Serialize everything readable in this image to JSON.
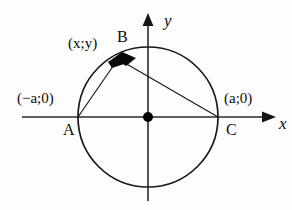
{
  "figure": {
    "kind": "geometry-diagram",
    "background_color": "#fdfdfd",
    "ink_color": "#0d0d0d"
  },
  "axes": {
    "x_label": "x",
    "y_label": "y",
    "origin_marker": "filled-dot"
  },
  "labels": {
    "point_a": "A",
    "point_b": "B",
    "point_c": "C",
    "coord_a": "(−a;0)",
    "coord_c": "(a;0)",
    "coord_b": "(x;y)"
  },
  "geometry": {
    "circle": {
      "center_x": 148,
      "center_y": 117,
      "radius": 70
    },
    "points": {
      "a": {
        "x": 78,
        "y": 117
      },
      "b": {
        "x": 118,
        "y": 59
      },
      "c": {
        "x": 218,
        "y": 117
      },
      "origin": {
        "x": 148,
        "y": 117
      }
    },
    "chords": [
      "A-B",
      "B-C"
    ],
    "x_axis": {
      "x1": 22,
      "x2": 275,
      "y": 117
    },
    "y_axis": {
      "x": 148,
      "y1": 14,
      "y2": 201
    }
  },
  "colors": {
    "stroke": "#1a1a1a",
    "axis": "#2a2a2a",
    "marker": "#000000"
  }
}
